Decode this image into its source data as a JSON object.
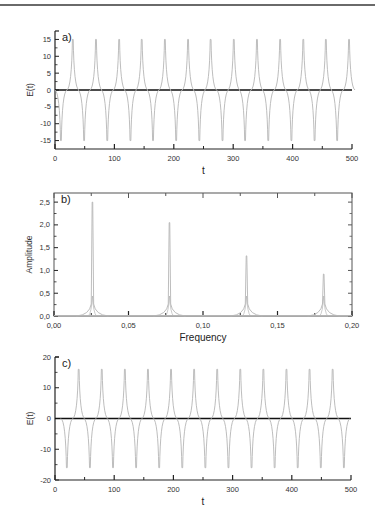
{
  "chart_data": [
    {
      "type": "line",
      "panel_label": "a)",
      "xlabel": "t",
      "ylabel": "E(t)",
      "xlim": [
        0,
        500
      ],
      "ylim": [
        -17.5,
        17.5
      ],
      "x_ticks": [
        0,
        100,
        200,
        300,
        400,
        500
      ],
      "x_tick_labels": [
        "0",
        "100",
        "200",
        "300",
        "400",
        "500"
      ],
      "y_ticks": [
        15,
        10,
        5,
        0,
        -5,
        -10,
        -15
      ],
      "y_tick_labels": [
        "15",
        "10",
        "5",
        "0",
        "-5",
        "-10",
        "-15"
      ],
      "grid": false,
      "series": [
        {
          "name": "E(t)",
          "description": "periodic spike train, period ~38.8, alternating positive and negative spikes",
          "positive_peaks": {
            "t": [
              30,
              69,
              108,
              146,
              185,
              224,
              262,
              301,
              340,
              379,
              418,
              456,
              495
            ],
            "value": 15
          },
          "negative_peaks": {
            "t": [
              10,
              49,
              88,
              127,
              165,
              204,
              243,
              282,
              320,
              359,
              398,
              437,
              475
            ],
            "value": -15
          }
        }
      ]
    },
    {
      "type": "line",
      "panel_label": "b)",
      "xlabel": "Frequency",
      "ylabel": "Amplitude",
      "xlim": [
        0.0,
        0.2
      ],
      "ylim": [
        0.0,
        2.7
      ],
      "x_ticks": [
        0.0,
        0.05,
        0.1,
        0.15,
        0.2
      ],
      "x_tick_labels": [
        "0,00",
        "0,05",
        "0,10",
        "0,15",
        "0,20"
      ],
      "y_ticks": [
        0.0,
        0.5,
        1.0,
        1.5,
        2.0,
        2.5
      ],
      "y_tick_labels": [
        "0,0",
        "0,5",
        "1,0",
        "1,5",
        "2,0",
        "2,5"
      ],
      "grid": false,
      "series": [
        {
          "name": "Amplitude spectrum",
          "peaks": [
            {
              "frequency": 0.0258,
              "amplitude": 2.5
            },
            {
              "frequency": 0.0775,
              "amplitude": 2.05
            },
            {
              "frequency": 0.1292,
              "amplitude": 1.32
            },
            {
              "frequency": 0.181,
              "amplitude": 0.92
            }
          ]
        }
      ]
    },
    {
      "type": "line",
      "panel_label": "c)",
      "xlabel": "t",
      "ylabel": "E(t)",
      "xlim": [
        0,
        500
      ],
      "ylim": [
        -20,
        20
      ],
      "x_ticks": [
        0,
        100,
        200,
        300,
        400,
        500
      ],
      "x_tick_labels": [
        "0",
        "100",
        "200",
        "300",
        "400",
        "500"
      ],
      "y_ticks": [
        20,
        10,
        0,
        -10,
        -20
      ],
      "y_tick_labels": [
        "20",
        "10",
        "0",
        "-10",
        "-20"
      ],
      "grid": false,
      "series": [
        {
          "name": "E(t)",
          "description": "periodic spike train, period ~39, alternating negative and positive spikes",
          "positive_peaks": {
            "t": [
              40,
              79,
              118,
              157,
              196,
              235,
              274,
              313,
              352,
              391,
              430,
              469
            ],
            "value": 16
          },
          "negative_peaks": {
            "t": [
              20,
              59,
              98,
              137,
              176,
              215,
              254,
              293,
              332,
              371,
              410,
              449,
              488
            ],
            "value": -16
          }
        }
      ]
    }
  ]
}
